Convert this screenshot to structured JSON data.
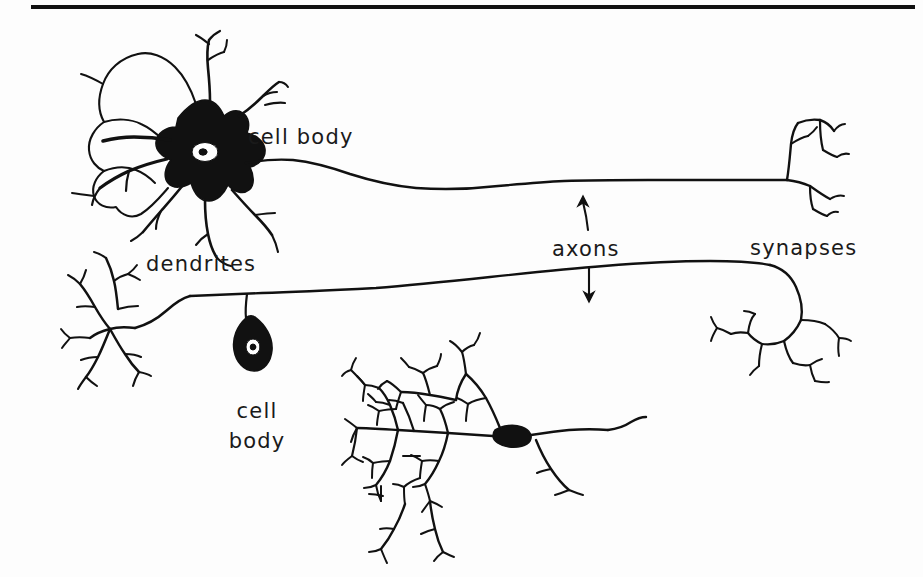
{
  "figure": {
    "background_color": "#fdfdfd",
    "ink_color": "#111111",
    "width": 923,
    "height": 577,
    "top_rule": {
      "name": "horizontal-rule",
      "x1": 31,
      "x2": 915,
      "y": 7,
      "thickness": 4,
      "color": "#111111"
    }
  },
  "labels": {
    "cell_body_top": "cell body",
    "dendrites": "dendrites",
    "axons": "axons",
    "synapses": "synapses",
    "cell_body_lower_line1": "cell",
    "cell_body_lower_line2": "body"
  },
  "annotations": {
    "arrow_up_target": "upper axon",
    "arrow_down_target": "lower axon"
  },
  "structures": [
    {
      "name": "upper-neuron",
      "parts": [
        "dendrites",
        "soma",
        "nucleus",
        "axon",
        "synapses"
      ],
      "soma_fill": "#111111",
      "nucleus_fill": "#ffffff"
    },
    {
      "name": "lower-left-neuron",
      "parts": [
        "dendrites",
        "soma",
        "axon",
        "synapses"
      ],
      "soma_fill": "#111111"
    },
    {
      "name": "bottom-center-neuron",
      "parts": [
        "dendritic arbor",
        "soma",
        "axon"
      ],
      "soma_fill": "#111111"
    }
  ]
}
